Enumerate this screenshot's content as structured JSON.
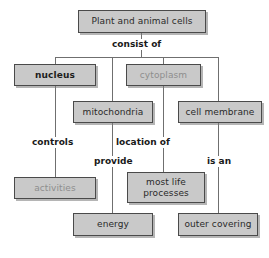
{
  "diagram": {
    "type": "concept-map",
    "background_color": "#ffffff",
    "node_fill_color": "#c9c9c9",
    "node_border_color": "#4a4a4a",
    "label_color": "#1a1a1a",
    "nodes": [
      {
        "id": "plant-and-animal-cells",
        "label": "Plant and animal cells",
        "x": 78,
        "y": 10,
        "w": 128,
        "h": 23,
        "style": "normal"
      },
      {
        "id": "nucleus",
        "label": "nucleus",
        "x": 14,
        "y": 64,
        "w": 82,
        "h": 22,
        "style": "bold"
      },
      {
        "id": "cytoplasm",
        "label": "cytoplasm",
        "x": 126,
        "y": 64,
        "w": 75,
        "h": 22,
        "style": "pale"
      },
      {
        "id": "mitochondria",
        "label": "mitochondria",
        "x": 73,
        "y": 101,
        "w": 80,
        "h": 22,
        "style": "normal"
      },
      {
        "id": "cell-membrane",
        "label": "cell membrane",
        "x": 178,
        "y": 101,
        "w": 84,
        "h": 22,
        "style": "normal"
      },
      {
        "id": "activities",
        "label": "activities",
        "x": 14,
        "y": 177,
        "w": 82,
        "h": 22,
        "style": "pale"
      },
      {
        "id": "most-life-processes",
        "label": "most life\nprocesses",
        "x": 127,
        "y": 172,
        "w": 78,
        "h": 31,
        "style": "normal"
      },
      {
        "id": "energy",
        "label": "energy",
        "x": 73,
        "y": 213,
        "w": 80,
        "h": 23,
        "style": "normal"
      },
      {
        "id": "outer-covering",
        "label": "outer covering",
        "x": 178,
        "y": 213,
        "w": 80,
        "h": 23,
        "style": "normal"
      }
    ],
    "edge_labels": [
      {
        "id": "consist-of",
        "text": "consist of",
        "x": 110,
        "y": 39
      },
      {
        "id": "controls",
        "text": "controls",
        "x": 30,
        "y": 137
      },
      {
        "id": "location-of",
        "text": "location of",
        "x": 114,
        "y": 137
      },
      {
        "id": "provide",
        "text": "provide",
        "x": 92,
        "y": 156
      },
      {
        "id": "is-an",
        "text": "is an",
        "x": 205,
        "y": 156
      }
    ],
    "edges": [
      {
        "from": "plant-and-animal-cells",
        "to": "nucleus",
        "label": "consist of"
      },
      {
        "from": "plant-and-animal-cells",
        "to": "mitochondria",
        "label": "consist of"
      },
      {
        "from": "plant-and-animal-cells",
        "to": "cytoplasm",
        "label": "consist of"
      },
      {
        "from": "plant-and-animal-cells",
        "to": "cell-membrane",
        "label": "consist of"
      },
      {
        "from": "nucleus",
        "to": "activities",
        "label": "controls"
      },
      {
        "from": "mitochondria",
        "to": "energy",
        "label": "provide"
      },
      {
        "from": "cytoplasm",
        "to": "most-life-processes",
        "label": "location of"
      },
      {
        "from": "cell-membrane",
        "to": "outer-covering",
        "label": "is an"
      }
    ]
  }
}
